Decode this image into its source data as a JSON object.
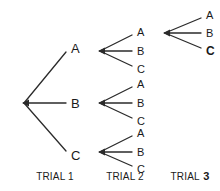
{
  "diagram": {
    "type": "tree-diagram",
    "title": "",
    "background_color": "#ffffff",
    "line_color": "#2b2b2b",
    "text_color": "#1a1a1a",
    "outcome_letters": [
      "A",
      "B",
      "C"
    ],
    "captions": [
      {
        "text": "TRIAL",
        "number": "1",
        "emphasis": false,
        "x": 55,
        "y": 171
      },
      {
        "text": "TRIAL",
        "number": "2",
        "emphasis": false,
        "x": 125,
        "y": 171
      },
      {
        "text": "TRIAL",
        "number": "3",
        "emphasis": true,
        "x": 190,
        "y": 171
      }
    ],
    "trial1": {
      "root": {
        "x": 22,
        "y": 103
      },
      "branches": [
        {
          "label": "A",
          "lx": 71,
          "ly": 48,
          "ex": 66,
          "ey": 52,
          "bold": false
        },
        {
          "label": "B",
          "lx": 71,
          "ly": 103,
          "ex": 66,
          "ey": 103,
          "bold": false
        },
        {
          "label": "C",
          "lx": 71,
          "ly": 155,
          "ex": 66,
          "ey": 151,
          "bold": false
        }
      ]
    },
    "trial2": {
      "fans": [
        {
          "root": {
            "x": 98,
            "y": 51
          },
          "branches": [
            {
              "label": "A",
              "lx": 137,
              "ly": 32,
              "ex": 132,
              "ey": 35,
              "bold": false
            },
            {
              "label": "B",
              "lx": 137,
              "ly": 51,
              "ex": 132,
              "ey": 51,
              "bold": false
            },
            {
              "label": "C",
              "lx": 137,
              "ly": 69,
              "ex": 132,
              "ey": 66,
              "bold": false
            }
          ]
        },
        {
          "root": {
            "x": 98,
            "y": 103
          },
          "branches": [
            {
              "label": "A",
              "lx": 137,
              "ly": 84,
              "ex": 132,
              "ey": 87,
              "bold": false
            },
            {
              "label": "B",
              "lx": 137,
              "ly": 103,
              "ex": 132,
              "ey": 103,
              "bold": false
            },
            {
              "label": "C",
              "lx": 137,
              "ly": 121,
              "ex": 132,
              "ey": 118,
              "bold": false
            }
          ]
        },
        {
          "root": {
            "x": 98,
            "y": 152
          },
          "branches": [
            {
              "label": "A",
              "lx": 137,
              "ly": 133,
              "ex": 132,
              "ey": 136,
              "bold": false
            },
            {
              "label": "B",
              "lx": 137,
              "ly": 152,
              "ex": 132,
              "ey": 152,
              "bold": false
            },
            {
              "label": "C",
              "lx": 137,
              "ly": 169,
              "ex": 132,
              "ey": 166,
              "bold": false
            }
          ]
        }
      ]
    },
    "trial3": {
      "root": {
        "x": 163,
        "y": 33
      },
      "branches": [
        {
          "label": "A",
          "lx": 206,
          "ly": 15,
          "ex": 201,
          "ey": 18,
          "bold": false
        },
        {
          "label": "B",
          "lx": 206,
          "ly": 33,
          "ex": 201,
          "ey": 33,
          "bold": false
        },
        {
          "label": "C",
          "lx": 206,
          "ly": 51,
          "ex": 201,
          "ey": 48,
          "bold": true
        }
      ]
    }
  }
}
